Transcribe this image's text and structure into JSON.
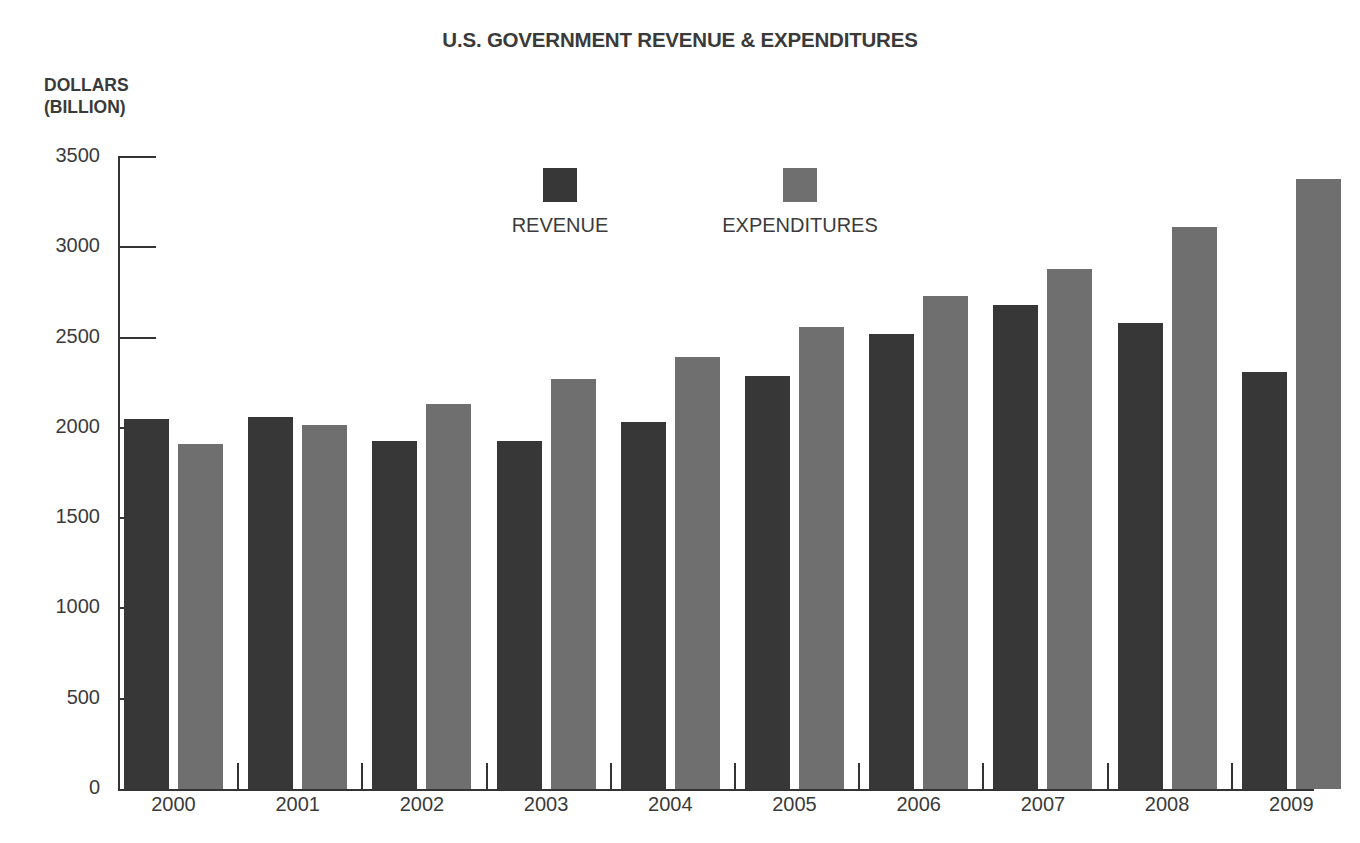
{
  "chart_data": {
    "type": "bar",
    "title": "U.S. GOVERNMENT REVENUE & EXPENDITURES",
    "subtitle": "",
    "xlabel": "",
    "ylabel": "DOLLARS (BILLION)",
    "ylabel_lines": [
      "DOLLARS",
      "(BILLION)"
    ],
    "categories": [
      "2000",
      "2001",
      "2002",
      "2003",
      "2004",
      "2005",
      "2006",
      "2007",
      "2008",
      "2009"
    ],
    "series": [
      {
        "name": "REVENUE",
        "color": "#373737",
        "values": [
          2050,
          2060,
          1930,
          1925,
          2030,
          2290,
          2520,
          2680,
          2580,
          2310
        ]
      },
      {
        "name": "EXPENDITURES",
        "color": "#6f6f6f",
        "values": [
          1910,
          2015,
          2130,
          2270,
          2390,
          2560,
          2730,
          2880,
          3110,
          3380
        ]
      }
    ],
    "ylim": [
      0,
      3500
    ],
    "ytick_values": [
      0,
      500,
      1000,
      1500,
      2000,
      2500,
      3000,
      3500
    ],
    "ytick_labels": [
      "0",
      "500",
      "1000",
      "1500",
      "2000",
      "2500",
      "3000",
      "3500"
    ],
    "major_ytick_values": [
      2500,
      3000,
      3500
    ],
    "grid": false,
    "legend_position": "inside-top-center",
    "legend": [
      {
        "label": "REVENUE",
        "color": "#373737"
      },
      {
        "label": "EXPENDITURES",
        "color": "#6f6f6f"
      }
    ],
    "background_color": "#ffffff",
    "axis_color": "#333333",
    "text_color": "#3b3b3b"
  }
}
